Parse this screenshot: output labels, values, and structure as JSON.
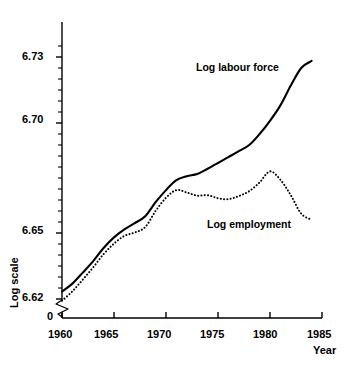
{
  "chart_data": {
    "type": "line",
    "title": "",
    "subtitle": "",
    "xlabel": "Year",
    "ylabel": "Log scale",
    "xlim": [
      1960,
      1985
    ],
    "ylim": [
      6.615,
      6.736
    ],
    "grid": false,
    "legend_position": "inline-annotations",
    "axis_break": true,
    "axis_break_note": "0",
    "x_ticks": [
      1960,
      1965,
      1970,
      1975,
      1980,
      1985
    ],
    "x_tick_labels": [
      "1960",
      "1965",
      "1970",
      "1975",
      "1980",
      "1985"
    ],
    "y_ticks": [
      6.62,
      6.65,
      6.7,
      6.73
    ],
    "y_tick_labels": [
      "6.62",
      "6.65",
      "6.70",
      "6.73"
    ],
    "y_minor_tick_step": 0.005,
    "origin_label": "0",
    "x": [
      1960,
      1961,
      1962,
      1963,
      1964,
      1965,
      1966,
      1967,
      1968,
      1969,
      1970,
      1971,
      1972,
      1973,
      1974,
      1975,
      1976,
      1977,
      1978,
      1979,
      1980,
      1981,
      1982,
      1983,
      1984
    ],
    "series": [
      {
        "name": "Log labour force",
        "style": "solid",
        "color": "#000000",
        "label": "Log labour force",
        "values": [
          6.6234,
          6.627,
          6.632,
          6.6372,
          6.6432,
          6.648,
          6.6516,
          6.6545,
          6.6576,
          6.664,
          6.6695,
          6.674,
          6.6758,
          6.6768,
          6.6792,
          6.6818,
          6.6845,
          6.6872,
          6.69,
          6.695,
          6.701,
          6.708,
          6.717,
          6.725,
          6.7282
        ]
      },
      {
        "name": "Log employment",
        "style": "dotted",
        "color": "#000000",
        "label": "Log employment",
        "values": [
          6.6192,
          6.6235,
          6.6288,
          6.6344,
          6.6404,
          6.6452,
          6.6487,
          6.6502,
          6.6527,
          6.66,
          6.666,
          6.6695,
          6.6684,
          6.667,
          6.6672,
          6.6658,
          6.6654,
          6.6668,
          6.669,
          6.673,
          6.678,
          6.6742,
          6.6672,
          6.6588,
          6.656
        ]
      }
    ]
  },
  "axis": {
    "y_title": "Log scale",
    "x_title": "Year"
  },
  "annotations": {
    "labour_force": "Log labour force",
    "employment": "Log employment"
  }
}
